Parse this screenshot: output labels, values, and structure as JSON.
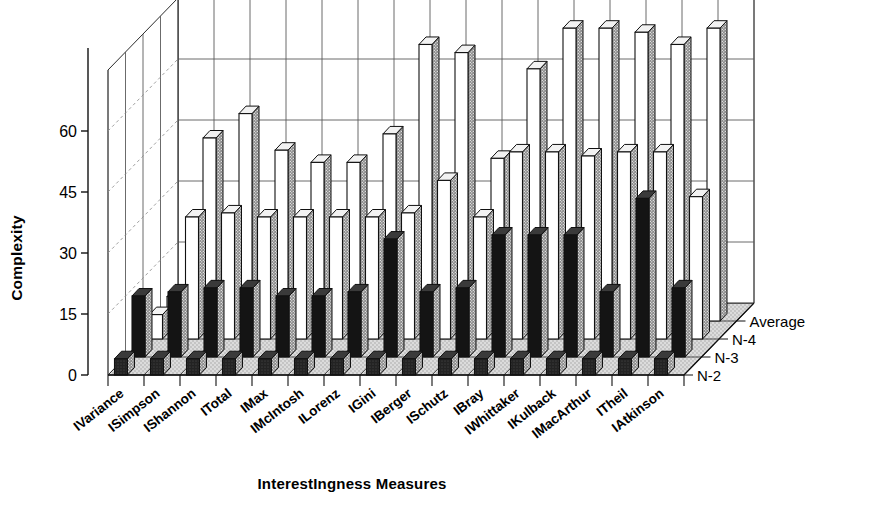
{
  "chart_data": {
    "type": "bar",
    "title": "",
    "subtitle": "",
    "xlabel": "InterestIngness Measures",
    "ylabel": "Complexity",
    "zlabel": "",
    "projection": "3d-grouped-bars",
    "grid": true,
    "legend_position": "right-depth-axis",
    "ylim": [
      0,
      75
    ],
    "yticks": [
      0,
      15,
      30,
      45,
      60
    ],
    "ytick_labels": [
      "0",
      "15",
      "30",
      "45",
      "60"
    ],
    "categories": [
      "IVariance",
      "ISimpson",
      "IShannon",
      "ITotal",
      "IMax",
      "IMcIntosh",
      "ILorenz",
      "IGini",
      "IBerger",
      "ISchutz",
      "IBray",
      "IWhittaker",
      "IKulback",
      "IMacArthur",
      "ITheil",
      "IAtkinson"
    ],
    "depth_categories": [
      "N-2",
      "N-3",
      "N-4",
      "Average"
    ],
    "series": [
      {
        "name": "N-2",
        "values": [
          4,
          4,
          4,
          4,
          4,
          4,
          4,
          4,
          4,
          4,
          4,
          4,
          4,
          4,
          4,
          4
        ]
      },
      {
        "name": "N-3",
        "values": [
          15,
          16,
          17,
          17,
          15,
          15,
          16,
          29,
          16,
          17,
          30,
          30,
          30,
          16,
          39,
          17
        ]
      },
      {
        "name": "N-4",
        "values": [
          6,
          30,
          31,
          30,
          30,
          30,
          30,
          31,
          39,
          30,
          46,
          46,
          45,
          46,
          46,
          35
        ]
      },
      {
        "name": "Average",
        "values": [
          6,
          45,
          51,
          42,
          39,
          39,
          46,
          68,
          66,
          40,
          62,
          72,
          72,
          71,
          68,
          72
        ]
      }
    ],
    "colors": {
      "n2": "#2b2b2b",
      "n3": "#171717",
      "n4": "#ffffff",
      "average": "#ffffff",
      "bar_side": "#6e6e6e",
      "floor": "#d7d7d7",
      "grid": "#4d4d4d",
      "axis": "#111111",
      "text": "#111111"
    }
  }
}
